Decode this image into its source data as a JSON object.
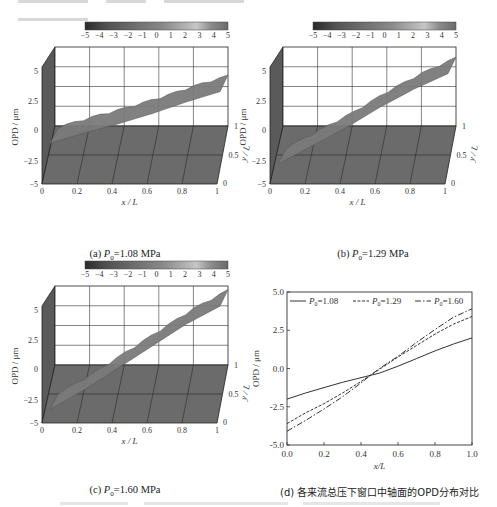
{
  "figure": {
    "colorbar": {
      "ticks": [
        "−5",
        "−4",
        "−3",
        "−2",
        "−1",
        "0",
        "1",
        "2",
        "3",
        "4",
        "5"
      ],
      "range": [
        -5,
        5
      ]
    },
    "panels": [
      {
        "id": "a",
        "caption_prefix": "(a) ",
        "caption_var": "P",
        "caption_sub": "0",
        "caption_value": "=1.08 MPa"
      },
      {
        "id": "b",
        "caption_prefix": "(b) ",
        "caption_var": "P",
        "caption_sub": "0",
        "caption_value": "=1.29 MPa"
      },
      {
        "id": "c",
        "caption_prefix": "(c) ",
        "caption_var": "P",
        "caption_sub": "0",
        "caption_value": "=1.60 MPa"
      },
      {
        "id": "d",
        "caption": "(d) 各来流总压下窗口中轴面的OPD分布对比"
      }
    ],
    "axes3d": {
      "zlabel": "OPD / μm",
      "xlabel": "x / L",
      "ylabel": "y / L",
      "zticks": [
        "5",
        "2.5",
        "0",
        "−2.5",
        "−5"
      ],
      "xticks": [
        "0",
        "0.2",
        "0.4",
        "0.6",
        "0.8",
        "1"
      ],
      "yticks": [
        "0",
        "0.5",
        "1"
      ]
    }
  },
  "chart_data": [
    {
      "type": "surface",
      "title": "(a) P0=1.08 MPa",
      "xlabel": "x/L",
      "ylabel": "y/L",
      "zlabel": "OPD/μm",
      "xlim": [
        0,
        1
      ],
      "ylim": [
        0,
        1
      ],
      "zlim": [
        -5,
        5
      ],
      "colorbar_range": [
        -5,
        5
      ],
      "x": [
        0,
        0.2,
        0.4,
        0.6,
        0.8,
        1.0
      ],
      "z_centerline": [
        -2.0,
        -1.2,
        -0.5,
        0.3,
        1.2,
        2.0
      ]
    },
    {
      "type": "surface",
      "title": "(b) P0=1.29 MPa",
      "xlabel": "x/L",
      "ylabel": "y/L",
      "zlabel": "OPD/μm",
      "xlim": [
        0,
        1
      ],
      "ylim": [
        0,
        1
      ],
      "zlim": [
        -5,
        5
      ],
      "colorbar_range": [
        -5,
        5
      ],
      "x": [
        0,
        0.2,
        0.4,
        0.6,
        0.8,
        1.0
      ],
      "z_centerline": [
        -3.6,
        -2.2,
        -0.8,
        0.8,
        2.2,
        3.4
      ]
    },
    {
      "type": "surface",
      "title": "(c) P0=1.60 MPa",
      "xlabel": "x/L",
      "ylabel": "y/L",
      "zlabel": "OPD/μm",
      "xlim": [
        0,
        1
      ],
      "ylim": [
        0,
        1
      ],
      "zlim": [
        -5,
        5
      ],
      "colorbar_range": [
        -5,
        5
      ],
      "x": [
        0,
        0.2,
        0.4,
        0.6,
        0.8,
        1.0
      ],
      "z_centerline": [
        -4.1,
        -2.6,
        -0.9,
        0.8,
        2.5,
        3.9
      ]
    },
    {
      "type": "line",
      "title": "(d) 各来流总压下窗口中轴面的OPD分布对比",
      "xlabel": "x/L",
      "ylabel": "OPD/μm",
      "xlim": [
        0,
        1.0
      ],
      "ylim": [
        -5.0,
        5.0
      ],
      "xticks": [
        "0.0",
        "0.2",
        "0.4",
        "0.6",
        "0.8",
        "1.0"
      ],
      "yticks": [
        "5.0",
        "2.5",
        "0.0",
        "-2.5",
        "-5.0"
      ],
      "grid": false,
      "legend_position": "top",
      "x": [
        0.0,
        0.1,
        0.2,
        0.3,
        0.4,
        0.45,
        0.5,
        0.6,
        0.7,
        0.8,
        0.9,
        1.0
      ],
      "series": [
        {
          "name": "P0=1.08",
          "style": "solid",
          "values": [
            -2.0,
            -1.6,
            -1.25,
            -0.9,
            -0.6,
            -0.45,
            -0.3,
            0.15,
            0.65,
            1.15,
            1.6,
            2.0
          ]
        },
        {
          "name": "P0=1.29",
          "style": "dotted",
          "values": [
            -3.6,
            -2.9,
            -2.3,
            -1.6,
            -0.85,
            -0.45,
            -0.05,
            0.75,
            1.5,
            2.25,
            2.9,
            3.4
          ]
        },
        {
          "name": "P0=1.60",
          "style": "dash-dot",
          "values": [
            -4.1,
            -3.4,
            -2.65,
            -1.85,
            -0.95,
            -0.45,
            0.0,
            0.8,
            1.7,
            2.55,
            3.35,
            3.9
          ]
        }
      ]
    }
  ]
}
